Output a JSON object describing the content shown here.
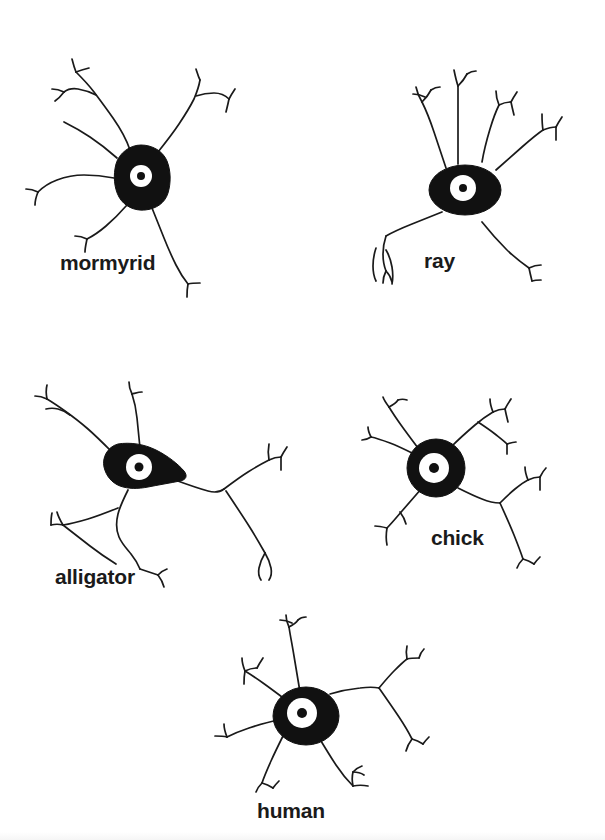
{
  "figure": {
    "width": 605,
    "height": 840,
    "background_color": "#ffffff",
    "ink_color": "#1a1a1a",
    "soma_fill_color": "#111111",
    "nucleus_fill_color": "#ffffff"
  },
  "neurons": [
    {
      "id": "mormyrid",
      "label": "mormyrid",
      "soma_shape": "rounded-vertical-blob",
      "soma_center": [
        141,
        176
      ],
      "soma_width": 56,
      "soma_height": 62,
      "nucleus_radius": 11,
      "dendrite_count": 6,
      "label_position": [
        60,
        252
      ]
    },
    {
      "id": "ray",
      "label": "ray",
      "soma_shape": "wide-horizontal-ellipse",
      "soma_center": [
        465,
        180
      ],
      "soma_width": 72,
      "soma_height": 50,
      "nucleus_radius": 13,
      "dendrite_count": 6,
      "label_position": [
        424,
        250
      ]
    },
    {
      "id": "alligator",
      "label": "alligator",
      "soma_shape": "rounded-triangle-tapering-right",
      "soma_center": [
        140,
        467
      ],
      "soma_width": 70,
      "soma_height": 48,
      "nucleus_radius": 13,
      "dendrite_count": 6,
      "label_position": [
        55,
        566
      ]
    },
    {
      "id": "chick",
      "label": "chick",
      "soma_shape": "round-ring",
      "soma_center": [
        434,
        465
      ],
      "soma_width": 54,
      "soma_height": 54,
      "nucleus_radius": 14,
      "dendrite_count": 6,
      "label_position": [
        431,
        527
      ]
    },
    {
      "id": "human",
      "label": "human",
      "soma_shape": "round-ring",
      "soma_center": [
        306,
        705
      ],
      "soma_width": 62,
      "soma_height": 54,
      "nucleus_radius": 14,
      "dendrite_count": 7,
      "label_position": [
        257,
        800
      ]
    }
  ]
}
